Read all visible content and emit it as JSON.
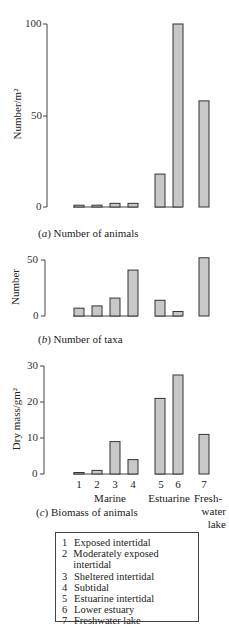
{
  "chart_data": [
    {
      "type": "bar",
      "title": "(a) Number of animals",
      "ylabel": "Number/m²",
      "ylim": [
        0,
        100
      ],
      "yticks": [
        0,
        50,
        100
      ],
      "categories": [
        "1",
        "2",
        "3",
        "4",
        "5",
        "6",
        "7"
      ],
      "values": [
        1,
        1,
        2,
        2,
        18,
        100,
        58
      ]
    },
    {
      "type": "bar",
      "title": "(b) Number of taxa",
      "ylabel": "Number",
      "ylim": [
        0,
        50
      ],
      "yticks": [
        0,
        50
      ],
      "categories": [
        "1",
        "2",
        "3",
        "4",
        "5",
        "6",
        "7"
      ],
      "values": [
        7,
        9,
        16,
        41,
        14,
        4,
        52
      ]
    },
    {
      "type": "bar",
      "title": "(c) Biomass of animals",
      "ylabel": "Dry mass/gm²",
      "ylim": [
        0,
        30
      ],
      "yticks": [
        0,
        10,
        20,
        30
      ],
      "categories": [
        "1",
        "2",
        "3",
        "4",
        "5",
        "6",
        "7"
      ],
      "values": [
        0.3,
        1,
        9,
        4,
        21,
        27.5,
        11
      ],
      "groups": [
        "Marine",
        "Estuarine",
        "Fresh-water lake"
      ]
    }
  ],
  "axes": {
    "a": {
      "t0": "0",
      "t50": "50",
      "t100": "100",
      "ylabel": "Number/m²",
      "caption_letter": "a",
      "caption_text": " Number of animals"
    },
    "b": {
      "t0": "0",
      "t50": "50",
      "ylabel": "Number",
      "caption_letter": "b",
      "caption_text": " Number of taxa"
    },
    "c": {
      "t0": "0",
      "t10": "10",
      "t20": "20",
      "t30": "30",
      "ylabel": "Dry mass/gm²",
      "caption_letter": "c",
      "caption_text": " Biomass of animals"
    }
  },
  "xlabels": [
    "1",
    "2",
    "3",
    "4",
    "5",
    "6",
    "7"
  ],
  "groups": {
    "marine": "Marine",
    "estuarine": "Estuarine",
    "fresh1": "Fresh-",
    "fresh2": "water",
    "fresh3": "lake"
  },
  "legend": [
    {
      "num": "1",
      "label": "Exposed intertidal"
    },
    {
      "num": "2",
      "label": "Moderately exposed intertidal"
    },
    {
      "num": "3",
      "label": "Sheltered intertidal"
    },
    {
      "num": "4",
      "label": "Subtidal"
    },
    {
      "num": "5",
      "label": "Estuarine intertidal"
    },
    {
      "num": "6",
      "label": "Lower estuary"
    },
    {
      "num": "7",
      "label": "Freshwater lake"
    }
  ],
  "colors": {
    "bar_fill": "#c8c8c8",
    "bar_stroke": "#333333",
    "axis": "#444444"
  }
}
